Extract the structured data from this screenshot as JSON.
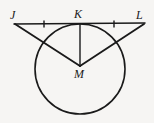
{
  "figure": {
    "kind": "geometry-diagram",
    "background_color": "#f6f5f3",
    "stroke_color": "#1a1a1a",
    "label_color": "#1a1a1a",
    "points": {
      "J": {
        "label": "J",
        "x": 15,
        "y": 24,
        "label_x": 10,
        "label_y": 9
      },
      "K": {
        "label": "K",
        "x": 80,
        "y": 24,
        "label_x": 74,
        "label_y": 8
      },
      "L": {
        "label": "L",
        "x": 144,
        "y": 24,
        "label_x": 136,
        "label_y": 9
      },
      "M": {
        "label": "M",
        "x": 80,
        "y": 65,
        "label_x": 74,
        "label_y": 68
      }
    },
    "circle": {
      "center_x": 80,
      "center_y": 69,
      "radius": 45,
      "stroke_width": 1.6
    },
    "segments": [
      {
        "name": "segment-JL",
        "x1": 14,
        "y1": 24,
        "x2": 145,
        "y2": 23,
        "stroke_width": 1.6
      },
      {
        "name": "segment-JM",
        "x1": 15,
        "y1": 24,
        "x2": 80,
        "y2": 66,
        "stroke_width": 1.8
      },
      {
        "name": "segment-LM",
        "x1": 144,
        "y1": 24,
        "x2": 80,
        "y2": 66,
        "stroke_width": 1.8
      },
      {
        "name": "segment-KM",
        "x1": 80,
        "y1": 24,
        "x2": 80,
        "y2": 66,
        "stroke_width": 1.4
      }
    ],
    "tick_marks": [
      {
        "name": "tick-JK",
        "x": 44,
        "y": 24,
        "height": 7,
        "stroke_width": 1.4
      },
      {
        "name": "tick-KL",
        "x": 114,
        "y": 24,
        "height": 7,
        "stroke_width": 1.4
      }
    ]
  }
}
